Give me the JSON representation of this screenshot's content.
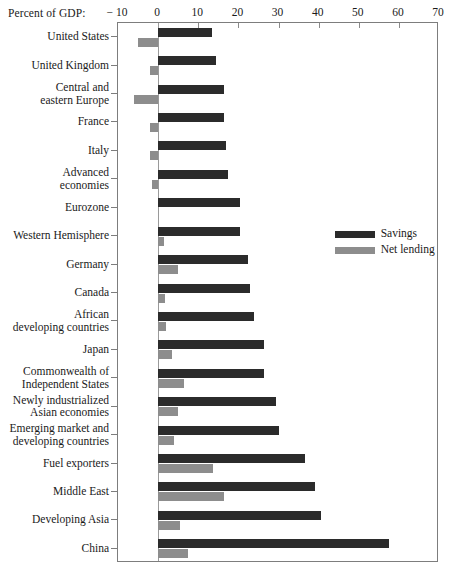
{
  "chart_data": {
    "type": "bar",
    "orientation": "horizontal",
    "title": "",
    "xlabel": "Percent of GDP:",
    "ylabel": "",
    "xlim": [
      -10,
      70
    ],
    "xticks": [
      -10,
      0,
      10,
      20,
      30,
      40,
      50,
      60,
      70
    ],
    "xtick_labels": [
      "− 10",
      "0",
      "10",
      "20",
      "30",
      "40",
      "50",
      "60",
      "70"
    ],
    "grid": false,
    "legend_position": "middle-right",
    "colors": {
      "savings": "#2b2b2b",
      "net_lending": "#8d8d8d",
      "frame": "#7d7d7d"
    },
    "legend": [
      {
        "label": "Savings",
        "color": "#2b2b2b"
      },
      {
        "label": "Net lending",
        "color": "#8d8d8d"
      }
    ],
    "categories": [
      "United States",
      "United Kingdom",
      "Central and\neastern Europe",
      "France",
      "Italy",
      "Advanced\neconomies",
      "Eurozone",
      "Western Hemisphere",
      "Germany",
      "Canada",
      "African\ndeveloping countries",
      "Japan",
      "Commonwealth of\nIndependent States",
      "Newly industrialized\nAsian economies",
      "Emerging market and\ndeveloping countries",
      "Fuel exporters",
      "Middle East",
      "Developing Asia",
      "China"
    ],
    "series": [
      {
        "name": "Savings",
        "values": [
          13.5,
          14.5,
          16.5,
          16.5,
          17.0,
          17.5,
          20.5,
          20.5,
          22.5,
          23.0,
          24.0,
          26.5,
          26.5,
          29.5,
          30.0,
          36.5,
          39.0,
          40.5,
          57.5
        ]
      },
      {
        "name": "Net lending",
        "values": [
          -5.0,
          -2.0,
          -6.0,
          -2.0,
          -2.0,
          -1.5,
          0.0,
          1.5,
          5.0,
          1.8,
          2.0,
          3.5,
          6.5,
          5.0,
          4.0,
          13.8,
          16.5,
          5.5,
          7.5
        ]
      }
    ]
  }
}
